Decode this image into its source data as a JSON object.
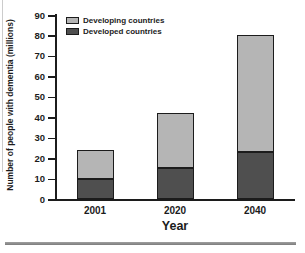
{
  "chart_data": {
    "type": "bar",
    "subtype": "stacked",
    "title": "",
    "xlabel": "Year",
    "ylabel": "Number of people with dementia (millions)",
    "categories": [
      "2001",
      "2020",
      "2040"
    ],
    "series": [
      {
        "name": "Developed countries",
        "values": [
          10,
          15,
          23
        ],
        "color": "#4f4f4f"
      },
      {
        "name": "Developing countries",
        "values": [
          14,
          27,
          57
        ],
        "color": "#b5b5b5"
      }
    ],
    "totals": [
      24,
      42,
      80
    ],
    "ylim": [
      0,
      90
    ],
    "yticks": [
      0,
      10,
      20,
      30,
      40,
      50,
      60,
      70,
      80,
      90
    ],
    "grid": false,
    "legend_position": "top-left",
    "legend_order": [
      "Developing countries",
      "Developed countries"
    ],
    "colors": {
      "axis": "#1c1c1c",
      "bar_border": "#1c1c1c",
      "text": "#1c1c1c",
      "divider": "#8a8a8a"
    }
  }
}
